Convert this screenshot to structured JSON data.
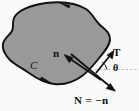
{
  "figure": {
    "width": 139,
    "height": 111,
    "background_color": "#fafafa",
    "region_fill_color": "#999999",
    "outline_color": "#111111",
    "vector_color": "#111111",
    "dashed_line_color": "#b5b5b5"
  },
  "labels": {
    "inward_normal": "n",
    "tangent": "T",
    "angle": "θ",
    "curve": "C",
    "outward_normal_equation": "N = −n"
  },
  "annotations": {
    "curve_orientation": "counterclockwise",
    "curve_arrowheads": 2,
    "angle_marker": "small arc between dashed horizontal reference line and tangent vector T"
  }
}
